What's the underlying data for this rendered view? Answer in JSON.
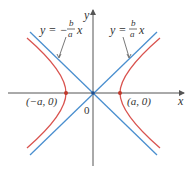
{
  "figure": {
    "type": "hyperbola",
    "axes": {
      "x_label": "x",
      "y_label": "y",
      "origin_label": "0"
    },
    "vertices": [
      {
        "label": "(−a, 0)",
        "name": "left-vertex"
      },
      {
        "label": "(a, 0)",
        "name": "right-vertex"
      }
    ],
    "asymptotes": [
      {
        "name": "negative-slope-asymptote",
        "lhs": "y = −",
        "frac_num": "b",
        "frac_den": "a",
        "rhs": "x"
      },
      {
        "name": "positive-slope-asymptote",
        "lhs": "y =",
        "frac_num": "b",
        "frac_den": "a",
        "rhs": "x"
      }
    ],
    "colors": {
      "axis": "#555555",
      "asymptote": "#4a8fcf",
      "hyperbola": "#d9534f",
      "vertex_dot": "#c0392b",
      "origin_dot": "#1f4e8c",
      "label": "#333333"
    }
  }
}
